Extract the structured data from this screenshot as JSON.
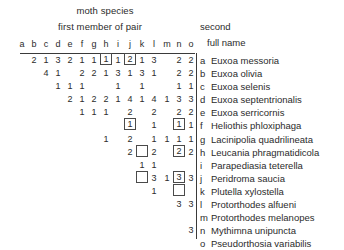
{
  "titles": {
    "moth_species": "moth species",
    "first_member": "first member of pair",
    "second": "second",
    "full_name": "full name"
  },
  "column_headers": [
    "a",
    "b",
    "c",
    "d",
    "e",
    "f",
    "g",
    "h",
    "i",
    "j",
    "k",
    "l",
    "m",
    "n",
    "o"
  ],
  "species": [
    {
      "key": "a",
      "name": "Euxoa messoria"
    },
    {
      "key": "b",
      "name": "Euxoa olivia"
    },
    {
      "key": "c",
      "name": "Euxoa selenis"
    },
    {
      "key": "d",
      "name": "Euxoa septentrionalis"
    },
    {
      "key": "e",
      "name": "Euxoa serricornis"
    },
    {
      "key": "f",
      "name": "Heliothis phloxiphaga"
    },
    {
      "key": "g",
      "name": "Lacinipolia quadrilineata"
    },
    {
      "key": "h",
      "name": "Leucania phragmatidicola"
    },
    {
      "key": "i",
      "name": "Parapediasia teterella"
    },
    {
      "key": "j",
      "name": "Peridroma saucia"
    },
    {
      "key": "k",
      "name": "Plutella xylostella"
    },
    {
      "key": "l",
      "name": "Protorthodes alfueni"
    },
    {
      "key": "m",
      "name": "Protorthodes melanopes"
    },
    {
      "key": "n",
      "name": "Mythimna unipuncta"
    },
    {
      "key": "o",
      "name": "Pseudorthosia variabilis"
    }
  ],
  "chart_data": {
    "type": "table",
    "title": "moth species",
    "xlabel": "first member of pair",
    "ylabel": "second",
    "note": "Upper-triangular co-occurrence matrix of moth species pairs; boxed cells are highlighted entries, empty boxes are highlighted zero/blank entries.",
    "row_keys": [
      "a",
      "b",
      "c",
      "d",
      "e",
      "f",
      "g",
      "h",
      "i",
      "j",
      "k",
      "l",
      "m",
      "n",
      "o"
    ],
    "col_keys": [
      "a",
      "b",
      "c",
      "d",
      "e",
      "f",
      "g",
      "h",
      "i",
      "j",
      "k",
      "l",
      "m",
      "n",
      "o"
    ],
    "rows": [
      {
        "row": "a",
        "cells": [
          {
            "col": "b",
            "value": "2",
            "box": "none"
          },
          {
            "col": "c",
            "value": "1",
            "box": "none"
          },
          {
            "col": "d",
            "value": "3",
            "box": "none"
          },
          {
            "col": "e",
            "value": "2",
            "box": "none"
          },
          {
            "col": "f",
            "value": "1",
            "box": "none"
          },
          {
            "col": "g",
            "value": "1",
            "box": "none"
          },
          {
            "col": "h",
            "value": "1",
            "box": "value"
          },
          {
            "col": "i",
            "value": "1",
            "box": "none"
          },
          {
            "col": "j",
            "value": "2",
            "box": "value"
          },
          {
            "col": "k",
            "value": "1",
            "box": "none"
          },
          {
            "col": "l",
            "value": "3",
            "box": "none"
          },
          {
            "col": "n",
            "value": "2",
            "box": "none"
          },
          {
            "col": "o",
            "value": "2",
            "box": "none"
          }
        ]
      },
      {
        "row": "b",
        "cells": [
          {
            "col": "c",
            "value": "4",
            "box": "none"
          },
          {
            "col": "d",
            "value": "1",
            "box": "none"
          },
          {
            "col": "f",
            "value": "2",
            "box": "none"
          },
          {
            "col": "g",
            "value": "2",
            "box": "none"
          },
          {
            "col": "h",
            "value": "1",
            "box": "none"
          },
          {
            "col": "i",
            "value": "3",
            "box": "none"
          },
          {
            "col": "j",
            "value": "1",
            "box": "none"
          },
          {
            "col": "k",
            "value": "3",
            "box": "none"
          },
          {
            "col": "l",
            "value": "1",
            "box": "none"
          },
          {
            "col": "n",
            "value": "2",
            "box": "none"
          },
          {
            "col": "o",
            "value": "2",
            "box": "none"
          }
        ]
      },
      {
        "row": "c",
        "cells": [
          {
            "col": "d",
            "value": "1",
            "box": "none"
          },
          {
            "col": "e",
            "value": "1",
            "box": "none"
          },
          {
            "col": "f",
            "value": "1",
            "box": "none"
          },
          {
            "col": "i",
            "value": "1",
            "box": "none"
          },
          {
            "col": "k",
            "value": "1",
            "box": "none"
          },
          {
            "col": "n",
            "value": "1",
            "box": "none"
          },
          {
            "col": "o",
            "value": "1",
            "box": "none"
          }
        ]
      },
      {
        "row": "d",
        "cells": [
          {
            "col": "e",
            "value": "2",
            "box": "none"
          },
          {
            "col": "f",
            "value": "1",
            "box": "none"
          },
          {
            "col": "g",
            "value": "2",
            "box": "none"
          },
          {
            "col": "h",
            "value": "2",
            "box": "none"
          },
          {
            "col": "i",
            "value": "1",
            "box": "none"
          },
          {
            "col": "j",
            "value": "4",
            "box": "none"
          },
          {
            "col": "k",
            "value": "1",
            "box": "none"
          },
          {
            "col": "l",
            "value": "4",
            "box": "none"
          },
          {
            "col": "m",
            "value": "1",
            "box": "none"
          },
          {
            "col": "n",
            "value": "3",
            "box": "none"
          },
          {
            "col": "o",
            "value": "3",
            "box": "none"
          }
        ]
      },
      {
        "row": "e",
        "cells": [
          {
            "col": "f",
            "value": "1",
            "box": "none"
          },
          {
            "col": "g",
            "value": "1",
            "box": "none"
          },
          {
            "col": "h",
            "value": "1",
            "box": "none"
          },
          {
            "col": "j",
            "value": "2",
            "box": "none"
          },
          {
            "col": "l",
            "value": "2",
            "box": "none"
          },
          {
            "col": "n",
            "value": "2",
            "box": "none"
          },
          {
            "col": "o",
            "value": "2",
            "box": "none"
          }
        ]
      },
      {
        "row": "f",
        "cells": [
          {
            "col": "j",
            "value": "1",
            "box": "value"
          },
          {
            "col": "l",
            "value": "1",
            "box": "none"
          },
          {
            "col": "n",
            "value": "1",
            "box": "value"
          },
          {
            "col": "o",
            "value": "1",
            "box": "none"
          }
        ]
      },
      {
        "row": "g",
        "cells": [
          {
            "col": "h",
            "value": "1",
            "box": "none"
          },
          {
            "col": "j",
            "value": "2",
            "box": "none"
          },
          {
            "col": "l",
            "value": "1",
            "box": "none"
          },
          {
            "col": "m",
            "value": "1",
            "box": "none"
          },
          {
            "col": "n",
            "value": "1",
            "box": "none"
          },
          {
            "col": "o",
            "value": "1",
            "box": "none"
          }
        ]
      },
      {
        "row": "h",
        "cells": [
          {
            "col": "j",
            "value": "2",
            "box": "none"
          },
          {
            "col": "k",
            "value": "",
            "box": "empty"
          },
          {
            "col": "l",
            "value": "2",
            "box": "none"
          },
          {
            "col": "n",
            "value": "2",
            "box": "value"
          },
          {
            "col": "o",
            "value": "2",
            "box": "none"
          }
        ]
      },
      {
        "row": "i",
        "cells": [
          {
            "col": "k",
            "value": "1",
            "box": "none"
          },
          {
            "col": "l",
            "value": "1",
            "box": "none"
          }
        ]
      },
      {
        "row": "j",
        "cells": [
          {
            "col": "k",
            "value": "",
            "box": "empty"
          },
          {
            "col": "l",
            "value": "3",
            "box": "none"
          },
          {
            "col": "m",
            "value": "1",
            "box": "none"
          },
          {
            "col": "n",
            "value": "3",
            "box": "value"
          },
          {
            "col": "o",
            "value": "3",
            "box": "none"
          }
        ]
      },
      {
        "row": "k",
        "cells": [
          {
            "col": "l",
            "value": "1",
            "box": "none"
          },
          {
            "col": "n",
            "value": "",
            "box": "empty"
          }
        ]
      },
      {
        "row": "l",
        "cells": [
          {
            "col": "n",
            "value": "3",
            "box": "none"
          },
          {
            "col": "o",
            "value": "3",
            "box": "none"
          }
        ]
      },
      {
        "row": "m",
        "cells": []
      },
      {
        "row": "n",
        "cells": [
          {
            "col": "o",
            "value": "3",
            "box": "none"
          }
        ]
      },
      {
        "row": "o",
        "cells": []
      }
    ]
  }
}
